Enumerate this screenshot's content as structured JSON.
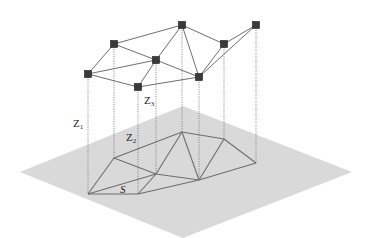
{
  "colors": {
    "background": "#ffffff",
    "plane": "#d9d9d9",
    "edge": "#6e6e6e",
    "dotted": "#777777",
    "node_fill": "#3a3a3a",
    "node_stroke": "#1a1a1a",
    "label": "#222222"
  },
  "plane": [
    [
      20,
      172
    ],
    [
      183,
      106
    ],
    [
      352,
      172
    ],
    [
      183,
      238
    ]
  ],
  "top_nodes": [
    {
      "id": "A",
      "x": 88,
      "y": 74
    },
    {
      "id": "B",
      "x": 114,
      "y": 44
    },
    {
      "id": "C",
      "x": 156,
      "y": 60
    },
    {
      "id": "D",
      "x": 182,
      "y": 25
    },
    {
      "id": "E",
      "x": 138,
      "y": 87
    },
    {
      "id": "F",
      "x": 199,
      "y": 77
    },
    {
      "id": "G",
      "x": 224,
      "y": 44
    },
    {
      "id": "H",
      "x": 256,
      "y": 25
    }
  ],
  "top_edges": [
    [
      "A",
      "B"
    ],
    [
      "A",
      "C"
    ],
    [
      "A",
      "E"
    ],
    [
      "B",
      "D"
    ],
    [
      "B",
      "C"
    ],
    [
      "C",
      "D"
    ],
    [
      "C",
      "E"
    ],
    [
      "C",
      "F"
    ],
    [
      "D",
      "F"
    ],
    [
      "E",
      "F"
    ],
    [
      "D",
      "G"
    ],
    [
      "G",
      "F"
    ],
    [
      "G",
      "H"
    ],
    [
      "H",
      "F"
    ]
  ],
  "ground_nodes": [
    {
      "id": "A",
      "x": 88,
      "y": 194
    },
    {
      "id": "B",
      "x": 114,
      "y": 158
    },
    {
      "id": "C",
      "x": 156,
      "y": 174
    },
    {
      "id": "D",
      "x": 182,
      "y": 132
    },
    {
      "id": "E",
      "x": 138,
      "y": 194
    },
    {
      "id": "F",
      "x": 199,
      "y": 180
    },
    {
      "id": "G",
      "x": 224,
      "y": 139
    },
    {
      "id": "H",
      "x": 256,
      "y": 163
    }
  ],
  "ground_edges": [
    [
      "A",
      "B"
    ],
    [
      "A",
      "C"
    ],
    [
      "A",
      "E"
    ],
    [
      "B",
      "D"
    ],
    [
      "B",
      "C"
    ],
    [
      "C",
      "D"
    ],
    [
      "C",
      "E"
    ],
    [
      "C",
      "F"
    ],
    [
      "D",
      "F"
    ],
    [
      "E",
      "F"
    ],
    [
      "D",
      "G"
    ],
    [
      "G",
      "F"
    ],
    [
      "G",
      "H"
    ],
    [
      "H",
      "F"
    ]
  ],
  "labels": {
    "z1": {
      "main": "Z",
      "sub": "1",
      "x": 73,
      "y": 127
    },
    "z2": {
      "main": "Z",
      "sub": "2",
      "x": 126,
      "y": 141
    },
    "z3": {
      "main": "Z",
      "sub": "3",
      "x": 144,
      "y": 104
    },
    "s": {
      "main": "S",
      "x": 120,
      "y": 193
    }
  }
}
